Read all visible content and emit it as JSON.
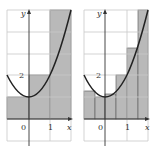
{
  "figure": {
    "left_panel": {
      "x_axis_label": "x",
      "y_axis_label": "y",
      "origin_label": "0",
      "x_tick_label": "1",
      "y_tick_label": "2",
      "rectangles": [
        {
          "x0": -1,
          "x1": 0,
          "height": 1
        },
        {
          "x0": 0,
          "x1": 1,
          "height": 2
        },
        {
          "x0": 1,
          "x1": 2,
          "height": 5
        }
      ]
    },
    "right_panel": {
      "x_axis_label": "x",
      "y_axis_label": "y",
      "origin_label": "0",
      "x_tick_label": "1",
      "y_tick_label": "2",
      "rectangles": [
        {
          "x0": -1,
          "x1": -0.5,
          "height": 1.3
        },
        {
          "x0": -0.5,
          "x1": 0,
          "height": 1.0
        },
        {
          "x0": 0,
          "x1": 0.5,
          "height": 1.15
        },
        {
          "x0": 0.5,
          "x1": 1,
          "height": 2.0
        },
        {
          "x0": 1,
          "x1": 1.5,
          "height": 3.25
        },
        {
          "x0": 1.5,
          "x1": 2,
          "height": 5
        }
      ]
    },
    "colors": {
      "shade": "#b9b9b9",
      "curve": "#222222",
      "grid": "#c8c8c8"
    }
  }
}
